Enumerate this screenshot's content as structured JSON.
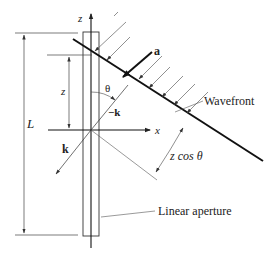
{
  "diagram": {
    "labels": {
      "z_axis": "z",
      "x_axis": "x",
      "length": "L",
      "z_height": "z",
      "theta": "θ",
      "neg_k": "−k",
      "k": "k",
      "a": "a",
      "wavefront": "Wavefront",
      "path_diff": "z cos θ",
      "aperture": "Linear aperture"
    },
    "colors": {
      "line": "#222222",
      "thin": "#555555",
      "background": "#ffffff"
    }
  }
}
